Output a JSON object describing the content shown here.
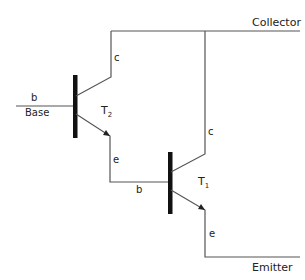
{
  "diagram": {
    "type": "darlington-pair",
    "terminals": {
      "collector": "Collector",
      "base": "Base",
      "emitter": "Emitter"
    },
    "transistors": [
      {
        "id": "T2",
        "label": "T",
        "subscript": "2",
        "pins": {
          "b": "b",
          "c": "c",
          "e": "e"
        }
      },
      {
        "id": "T1",
        "label": "T",
        "subscript": "1",
        "pins": {
          "b": "b",
          "c": "c",
          "e": "e"
        }
      }
    ]
  }
}
